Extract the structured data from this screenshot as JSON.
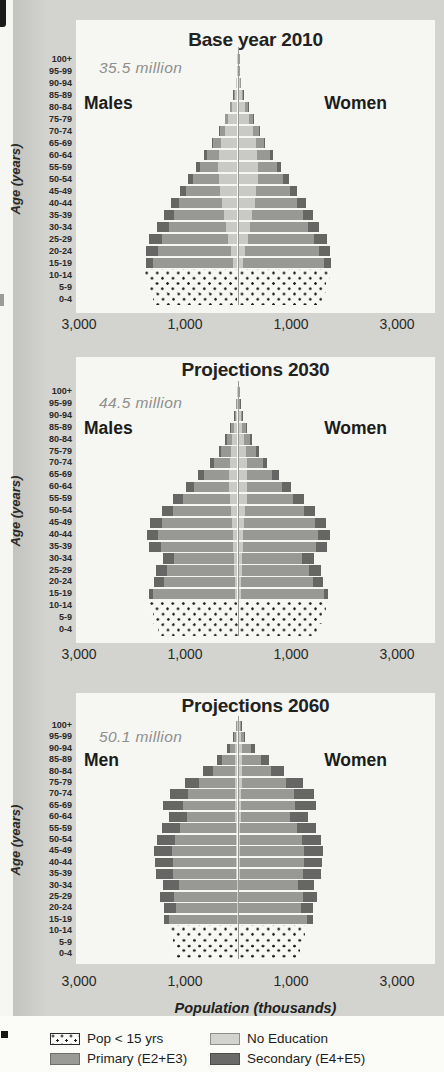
{
  "page": {
    "background": "#d3d3cf",
    "panel": "#f6f6f3"
  },
  "colors": {
    "no_education": "#c9c9c5",
    "primary": "#989895",
    "secondary": "#666664",
    "dots": "#1e1e1c",
    "axis_line": "#9a9a97",
    "title_text": "#222220",
    "annotation_text": "#8f8f8c"
  },
  "axis": {
    "x_label": "Population (thousands)",
    "y_label": "Age (years)",
    "ticks": [
      "3,000",
      "1,000",
      "1,000",
      "3,000"
    ],
    "tick_values": [
      -3000,
      -1000,
      1000,
      3000
    ],
    "xlim_thousands": [
      -3000,
      3000
    ],
    "units": "thousands per 5-year age group, males left / females right"
  },
  "legend": {
    "items": [
      {
        "label": "Pop < 15 yrs",
        "swatch": "dotted"
      },
      {
        "label": "No Education",
        "swatch": "none"
      },
      {
        "label": "Primary (E2+E3)",
        "swatch": "primary"
      },
      {
        "label": "Secondary (E4+E5)",
        "swatch": "secondary"
      }
    ]
  },
  "chart_data": [
    {
      "type": "bar",
      "subtype": "population-pyramid",
      "title": "Base year 2010",
      "annotation": "35.5 million",
      "left_label": "Males",
      "right_label": "Women",
      "stack_order": [
        "No Education",
        "Primary (E2+E3)",
        "Secondary (E4+E5)"
      ],
      "rows": [
        {
          "age": "100+",
          "m": [
            4,
            1,
            0
          ],
          "f": [
            6,
            2,
            0
          ]
        },
        {
          "age": "95-99",
          "m": [
            11,
            3,
            0
          ],
          "f": [
            14,
            5,
            0
          ]
        },
        {
          "age": "90-94",
          "m": [
            25,
            9,
            0
          ],
          "f": [
            31,
            12,
            0
          ]
        },
        {
          "age": "85-89",
          "m": [
            55,
            20,
            2
          ],
          "f": [
            66,
            25,
            3
          ]
        },
        {
          "age": "80-84",
          "m": [
            106,
            37,
            3
          ],
          "f": [
            126,
            44,
            4
          ]
        },
        {
          "age": "75-79",
          "m": [
            170,
            60,
            5
          ],
          "f": [
            200,
            72,
            6
          ]
        },
        {
          "age": "70-74",
          "m": [
            245,
            90,
            9
          ],
          "f": [
            278,
            102,
            11
          ]
        },
        {
          "age": "65-69",
          "m": [
            310,
            145,
            19
          ],
          "f": [
            330,
            155,
            21
          ]
        },
        {
          "age": "60-64",
          "m": [
            345,
            238,
            48
          ],
          "f": [
            355,
            245,
            52
          ]
        },
        {
          "age": "55-59",
          "m": [
            368,
            348,
            68
          ],
          "f": [
            372,
            352,
            72
          ]
        },
        {
          "age": "50-54",
          "m": [
            358,
            478,
            98
          ],
          "f": [
            362,
            482,
            102
          ]
        },
        {
          "age": "45-49",
          "m": [
            328,
            638,
            128
          ],
          "f": [
            332,
            642,
            132
          ]
        },
        {
          "age": "40-44",
          "m": [
            298,
            798,
            158
          ],
          "f": [
            302,
            802,
            162
          ]
        },
        {
          "age": "35-39",
          "m": [
            258,
            948,
            188
          ],
          "f": [
            262,
            952,
            192
          ]
        },
        {
          "age": "30-34",
          "m": [
            218,
            1078,
            218
          ],
          "f": [
            222,
            1082,
            222
          ]
        },
        {
          "age": "25-29",
          "m": [
            178,
            1238,
            248
          ],
          "f": [
            182,
            1242,
            252
          ]
        },
        {
          "age": "20-24",
          "m": [
            128,
            1378,
            218
          ],
          "f": [
            132,
            1382,
            222
          ]
        },
        {
          "age": "15-19",
          "m": [
            88,
            1508,
            138
          ],
          "f": [
            92,
            1512,
            142
          ]
        },
        {
          "age": "10-14",
          "dotted": true,
          "m": [
            1740
          ],
          "f": [
            1720
          ]
        },
        {
          "age": "5-9",
          "dotted": true,
          "m": [
            1680
          ],
          "f": [
            1660
          ]
        },
        {
          "age": "0-4",
          "dotted": true,
          "m": [
            1600
          ],
          "f": [
            1580
          ]
        }
      ]
    },
    {
      "type": "bar",
      "subtype": "population-pyramid",
      "title": "Projections 2030",
      "annotation": "44.5 million",
      "left_label": "Males",
      "right_label": "Women",
      "stack_order": [
        "No Education",
        "Primary (E2+E3)",
        "Secondary (E4+E5)"
      ],
      "rows": [
        {
          "age": "100+",
          "m": [
            6,
            3,
            1
          ],
          "f": [
            8,
            5,
            1
          ]
        },
        {
          "age": "95-99",
          "m": [
            14,
            10,
            2
          ],
          "f": [
            18,
            14,
            4
          ]
        },
        {
          "age": "90-94",
          "m": [
            31,
            24,
            6
          ],
          "f": [
            39,
            32,
            8
          ]
        },
        {
          "age": "85-89",
          "m": [
            60,
            60,
            16
          ],
          "f": [
            70,
            70,
            20
          ]
        },
        {
          "age": "80-84",
          "m": [
            95,
            110,
            28
          ],
          "f": [
            105,
            120,
            32
          ]
        },
        {
          "age": "75-79",
          "m": [
            125,
            185,
            48
          ],
          "f": [
            135,
            195,
            52
          ]
        },
        {
          "age": "70-74",
          "m": [
            146,
            296,
            78
          ],
          "f": [
            154,
            304,
            82
          ]
        },
        {
          "age": "65-69",
          "m": [
            158,
            466,
            118
          ],
          "f": [
            162,
            474,
            122
          ]
        },
        {
          "age": "60-64",
          "m": [
            158,
            656,
            158
          ],
          "f": [
            162,
            664,
            162
          ]
        },
        {
          "age": "55-59",
          "m": [
            148,
            876,
            188
          ],
          "f": [
            152,
            884,
            192
          ]
        },
        {
          "age": "50-54",
          "m": [
            128,
            1096,
            208
          ],
          "f": [
            132,
            1104,
            212
          ]
        },
        {
          "age": "45-49",
          "m": [
            108,
            1316,
            218
          ],
          "f": [
            112,
            1324,
            222
          ]
        },
        {
          "age": "40-44",
          "m": [
            88,
            1406,
            218
          ],
          "f": [
            92,
            1414,
            222
          ]
        },
        {
          "age": "35-39",
          "m": [
            78,
            1366,
            218
          ],
          "f": [
            82,
            1374,
            222
          ]
        },
        {
          "age": "30-34",
          "m": [
            68,
            1126,
            208
          ],
          "f": [
            72,
            1134,
            212
          ]
        },
        {
          "age": "25-29",
          "m": [
            58,
            1266,
            208
          ],
          "f": [
            62,
            1274,
            212
          ]
        },
        {
          "age": "20-24",
          "m": [
            48,
            1346,
            188
          ],
          "f": [
            52,
            1354,
            192
          ]
        },
        {
          "age": "15-19",
          "m": [
            38,
            1556,
            78
          ],
          "f": [
            42,
            1564,
            82
          ]
        },
        {
          "age": "10-14",
          "dotted": true,
          "m": [
            1680
          ],
          "f": [
            1660
          ]
        },
        {
          "age": "5-9",
          "dotted": true,
          "m": [
            1600
          ],
          "f": [
            1580
          ]
        },
        {
          "age": "0-4",
          "dotted": true,
          "m": [
            1500
          ],
          "f": [
            1480
          ]
        }
      ]
    },
    {
      "type": "bar",
      "subtype": "population-pyramid",
      "title": "Projections 2060",
      "annotation": "50.1 million",
      "left_label": "Men",
      "right_label": "Women",
      "stack_order": [
        "No Education",
        "Primary (E2+E3)",
        "Secondary (E4+E5)"
      ],
      "rows": [
        {
          "age": "100+",
          "m": [
            10,
            14,
            3
          ],
          "f": [
            20,
            26,
            7
          ]
        },
        {
          "age": "95-99",
          "m": [
            22,
            45,
            11
          ],
          "f": [
            38,
            75,
            19
          ]
        },
        {
          "age": "90-94",
          "m": [
            38,
            110,
            45
          ],
          "f": [
            62,
            175,
            75
          ]
        },
        {
          "age": "85-89",
          "m": [
            48,
            235,
            105
          ],
          "f": [
            72,
            350,
            155
          ]
        },
        {
          "age": "80-84",
          "m": [
            52,
            415,
            180
          ],
          "f": [
            68,
            550,
            235
          ]
        },
        {
          "age": "75-79",
          "m": [
            50,
            680,
            270
          ],
          "f": [
            60,
            835,
            325
          ]
        },
        {
          "age": "70-74",
          "m": [
            48,
            895,
            340
          ],
          "f": [
            52,
            990,
            375
          ]
        },
        {
          "age": "65-69",
          "m": [
            45,
            990,
            375
          ],
          "f": [
            45,
            1030,
            385
          ]
        },
        {
          "age": "60-64",
          "m": [
            40,
            915,
            330
          ],
          "f": [
            40,
            935,
            340
          ]
        },
        {
          "age": "55-59",
          "m": [
            35,
            1045,
            345
          ],
          "f": [
            35,
            1065,
            355
          ]
        },
        {
          "age": "50-54",
          "m": [
            30,
            1145,
            350
          ],
          "f": [
            30,
            1165,
            360
          ]
        },
        {
          "age": "45-49",
          "m": [
            25,
            1210,
            345
          ],
          "f": [
            25,
            1220,
            355
          ]
        },
        {
          "age": "40-44",
          "m": [
            22,
            1200,
            330
          ],
          "f": [
            22,
            1210,
            340
          ]
        },
        {
          "age": "35-39",
          "m": [
            20,
            1190,
            320
          ],
          "f": [
            20,
            1200,
            330
          ]
        },
        {
          "age": "30-34",
          "m": [
            18,
            1095,
            287
          ],
          "f": [
            18,
            1105,
            297
          ]
        },
        {
          "age": "25-29",
          "m": [
            15,
            1185,
            270
          ],
          "f": [
            15,
            1195,
            280
          ]
        },
        {
          "age": "20-24",
          "m": [
            12,
            1155,
            215
          ],
          "f": [
            12,
            1165,
            225
          ]
        },
        {
          "age": "15-19",
          "m": [
            10,
            1275,
            95
          ],
          "f": [
            10,
            1285,
            105
          ]
        },
        {
          "age": "10-14",
          "dotted": true,
          "m": [
            1270
          ],
          "f": [
            1250
          ]
        },
        {
          "age": "5-9",
          "dotted": true,
          "m": [
            1220
          ],
          "f": [
            1200
          ]
        },
        {
          "age": "0-4",
          "dotted": true,
          "m": [
            1180
          ],
          "f": [
            1160
          ]
        }
      ]
    }
  ]
}
